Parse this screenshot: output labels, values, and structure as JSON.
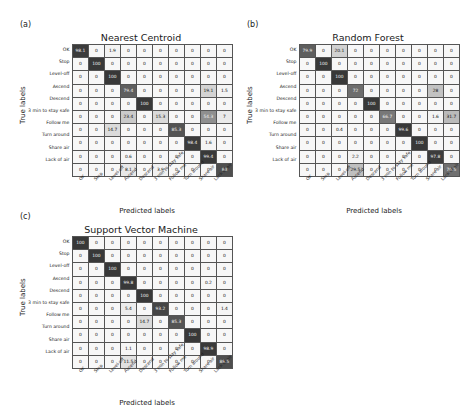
{
  "figure": {
    "axis_labels": {
      "x": "Predicted labels",
      "y": "True labels"
    },
    "classes": [
      "OK",
      "Stop",
      "Level-off",
      "Ascend",
      "Descend",
      "3 min to stay safe",
      "Follow me",
      "Turn around",
      "Share air",
      "Lack of air"
    ],
    "colors": {
      "low": "#f7f7f7",
      "high": "#3b3b3b",
      "border": "#555555",
      "text_dark": "#111111",
      "text_light": "#f2f2f2"
    }
  },
  "panels": [
    {
      "tag": "(a)",
      "title": "Nearest Centroid"
    },
    {
      "tag": "(b)",
      "title": "Random Forest"
    },
    {
      "tag": "(c)",
      "title": "Support Vector Machine"
    }
  ],
  "chart_data": [
    {
      "type": "heatmap",
      "title": "Nearest Centroid",
      "panel": "(a)",
      "xlabel": "Predicted labels",
      "ylabel": "True labels",
      "categories": [
        "OK",
        "Stop",
        "Level-off",
        "Ascend",
        "Descend",
        "3 min to stay safe",
        "Follow me",
        "Turn around",
        "Share air",
        "Lack of air"
      ],
      "zlim": [
        0,
        100
      ],
      "units": "percent",
      "values": [
        [
          98.1,
          0,
          1.9,
          0,
          0,
          0,
          0,
          0,
          0,
          0
        ],
        [
          0,
          100,
          0,
          0,
          0,
          0,
          0,
          0,
          0,
          0
        ],
        [
          0,
          0,
          100,
          0,
          0,
          0,
          0,
          0,
          0,
          0
        ],
        [
          0,
          0,
          0,
          79.4,
          0,
          0,
          0,
          0,
          19.1,
          1.5
        ],
        [
          0,
          0,
          0,
          0,
          100,
          0,
          0,
          0,
          0,
          0
        ],
        [
          0,
          0,
          0,
          23.4,
          0,
          15.3,
          0,
          0,
          54.3,
          7
        ],
        [
          0,
          0,
          14.7,
          0,
          0,
          0,
          85.3,
          0,
          0,
          0
        ],
        [
          0,
          0,
          0,
          0,
          0,
          0,
          0,
          98.4,
          1.6,
          0
        ],
        [
          0,
          0,
          0,
          0.6,
          0,
          0,
          0,
          0,
          99.4,
          0
        ],
        [
          0,
          0,
          0,
          8.1,
          0,
          3.9,
          0,
          0,
          0,
          88
        ]
      ]
    },
    {
      "type": "heatmap",
      "title": "Random Forest",
      "panel": "(b)",
      "xlabel": "Predicted labels",
      "ylabel": "True labels",
      "categories": [
        "OK",
        "Stop",
        "Level-off",
        "Ascend",
        "Descend",
        "3 min to stay safe",
        "Follow me",
        "Turn around",
        "Share air",
        "Lack of air"
      ],
      "zlim": [
        0,
        100
      ],
      "units": "percent",
      "values": [
        [
          79.9,
          0,
          20.1,
          0,
          0,
          0,
          0,
          0,
          0,
          0
        ],
        [
          0,
          100,
          0,
          0,
          0,
          0,
          0,
          0,
          0,
          0
        ],
        [
          0,
          0,
          100,
          0,
          0,
          0,
          0,
          0,
          0,
          0
        ],
        [
          0,
          0,
          0,
          72,
          0,
          0,
          0,
          0,
          28,
          0
        ],
        [
          0,
          0,
          0,
          0,
          100,
          0,
          0,
          0,
          0,
          0
        ],
        [
          0,
          0,
          0,
          0,
          0,
          66.7,
          0,
          0,
          1.6,
          31.7
        ],
        [
          0,
          0,
          0.4,
          0,
          0,
          0,
          99.6,
          0,
          0,
          0
        ],
        [
          0,
          0,
          0,
          0,
          0,
          0,
          0,
          100,
          0,
          0
        ],
        [
          0,
          0,
          0,
          2.2,
          0,
          0,
          0,
          0,
          97.8,
          0
        ],
        [
          0,
          0,
          0,
          29.5,
          0,
          0,
          0,
          0,
          0,
          70.5
        ]
      ]
    },
    {
      "type": "heatmap",
      "title": "Support Vector Machine",
      "panel": "(c)",
      "xlabel": "Predicted labels",
      "ylabel": "True labels",
      "categories": [
        "OK",
        "Stop",
        "Level-off",
        "Ascend",
        "Descend",
        "3 min to stay safe",
        "Follow me",
        "Turn around",
        "Share air",
        "Lack of air"
      ],
      "zlim": [
        0,
        100
      ],
      "units": "percent",
      "values": [
        [
          100,
          0,
          0,
          0,
          0,
          0,
          0,
          0,
          0,
          0
        ],
        [
          0,
          100,
          0,
          0,
          0,
          0,
          0,
          0,
          0,
          0
        ],
        [
          0,
          0,
          100,
          0,
          0,
          0,
          0,
          0,
          0,
          0
        ],
        [
          0,
          0,
          0,
          99.8,
          0,
          0,
          0,
          0,
          0.2,
          0
        ],
        [
          0,
          0,
          0,
          0,
          100,
          0,
          0,
          0,
          0,
          0
        ],
        [
          0,
          0,
          0,
          5.4,
          0,
          93.2,
          0,
          0,
          0,
          1.4
        ],
        [
          0,
          0,
          0,
          0,
          14.7,
          0,
          85.3,
          0,
          0,
          0
        ],
        [
          0,
          0,
          0,
          0,
          0,
          0,
          0,
          100,
          0,
          0
        ],
        [
          0,
          0,
          0,
          1.1,
          0,
          0,
          0,
          0,
          98.9,
          0
        ],
        [
          0,
          0,
          0,
          11.5,
          0,
          0,
          0,
          0,
          0,
          88.5
        ]
      ]
    }
  ]
}
